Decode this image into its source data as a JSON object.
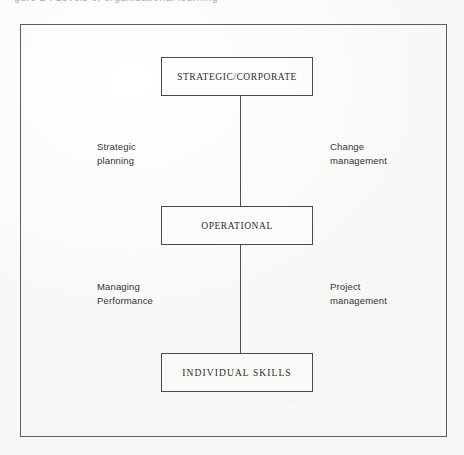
{
  "page": {
    "clipped_caption": "gure 2 : Levels of organisational learning",
    "background_color": "#fbfbfa",
    "frame_color": "#5d5d5d"
  },
  "diagram": {
    "type": "hierarchy",
    "orientation": "vertical",
    "nodes": [
      {
        "id": "strategic",
        "label": "STRATEGIC/CORPORATE",
        "level": 1
      },
      {
        "id": "operational",
        "label": "OPERATIONAL",
        "level": 2
      },
      {
        "id": "individual",
        "label": "INDIVIDUAL SKILLS",
        "level": 3
      }
    ],
    "connectors": [
      {
        "id": "upper",
        "from": "strategic",
        "to": "operational"
      },
      {
        "id": "lower",
        "from": "operational",
        "to": "individual"
      }
    ],
    "edge_labels": [
      {
        "id": "strategic-planning",
        "side": "left",
        "connector": "upper",
        "line1": "Strategic",
        "line2": "planning"
      },
      {
        "id": "change-management",
        "side": "right",
        "connector": "upper",
        "line1": "Change",
        "line2": "management"
      },
      {
        "id": "managing-performance",
        "side": "left",
        "connector": "lower",
        "line1": "Managing",
        "line2": "Performance"
      },
      {
        "id": "project-management",
        "side": "right",
        "connector": "lower",
        "line1": "Project",
        "line2": "management"
      }
    ]
  }
}
